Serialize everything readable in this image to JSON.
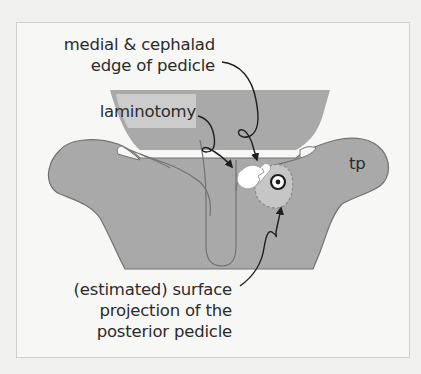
{
  "figure": {
    "labels": {
      "medial_edge": {
        "lines": [
          "medial & cephalad",
          "edge of pedicle"
        ]
      },
      "laminotomy": {
        "lines": [
          "laminotomy"
        ]
      },
      "transverse_process": {
        "lines": [
          "tp"
        ]
      },
      "pedicle_projection": {
        "lines": [
          "(estimated) surface",
          "projection of the",
          "posterior pedicle"
        ]
      }
    },
    "colors": {
      "background": "#f7f7f5",
      "bone_fill": "#a9a9a9",
      "bone_outline": "#727272",
      "pedicle_fill": "#c6c6c6",
      "laminotomy_fill": "#ffffff",
      "arrow": "#1e1e1e",
      "text": "#2b2b2b"
    },
    "markers": {
      "pedicle_target": "bullseye-icon"
    }
  }
}
